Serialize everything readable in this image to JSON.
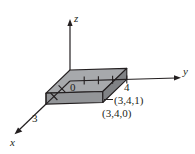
{
  "figure": {
    "background_color": "#ffffff",
    "line_color": "#231f20",
    "axes": [
      {
        "name": "z-axis",
        "label": "z",
        "direction": "up"
      },
      {
        "name": "y-axis",
        "label": "y",
        "direction": "right"
      },
      {
        "name": "x-axis",
        "label": "x",
        "direction": "down-left"
      }
    ],
    "origin_label": "0",
    "tick_values": {
      "x": "3",
      "y": "4"
    },
    "point_labels": [
      {
        "name": "top-corner-point",
        "text": "(3,4,1)"
      },
      {
        "name": "bottom-corner-point",
        "text": "(3,4,0)"
      }
    ],
    "box": {
      "top_face_color": "#a7a9ac",
      "front_face_color": "#939598",
      "side_face_color": "#808285",
      "edge_color": "#231f20",
      "dimensions": "3 x 4 x 1"
    },
    "tick_marks_count": 4
  }
}
